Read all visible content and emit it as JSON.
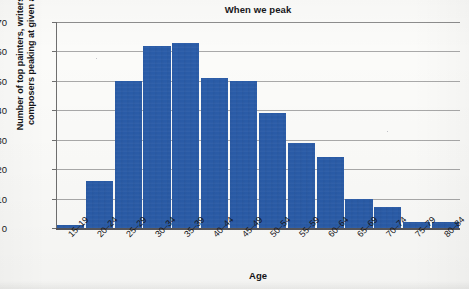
{
  "chart_data": {
    "type": "bar",
    "title": "When we peak",
    "xlabel": "Age",
    "ylabel": "Number of top painters, writers, and composers peaking at given ages",
    "ylabel_lines": [
      "Number of top painters, writers, and",
      "composers peaking at given ages"
    ],
    "categories": [
      "15–19",
      "20–24",
      "25–29",
      "30–34",
      "35–39",
      "40–44",
      "45–49",
      "50–54",
      "55–59",
      "60–64",
      "65–69",
      "70–74",
      "75–79",
      "80–84"
    ],
    "values": [
      1,
      16,
      50,
      62,
      63,
      51,
      50,
      39,
      29,
      24,
      10,
      7,
      2,
      2
    ],
    "ylim": [
      0,
      70
    ],
    "yticks": [
      0,
      10,
      20,
      30,
      40,
      50,
      60,
      70
    ],
    "ytick_labels": [
      "0",
      "10",
      "20",
      "30",
      "40",
      "50",
      "60",
      "70"
    ],
    "grid": true,
    "legend": "none",
    "bar_color": "#2a5ca8",
    "gridline_color": "#a9a9a9",
    "axis_color": "#55555a",
    "background_color": "#fbfbf9"
  }
}
